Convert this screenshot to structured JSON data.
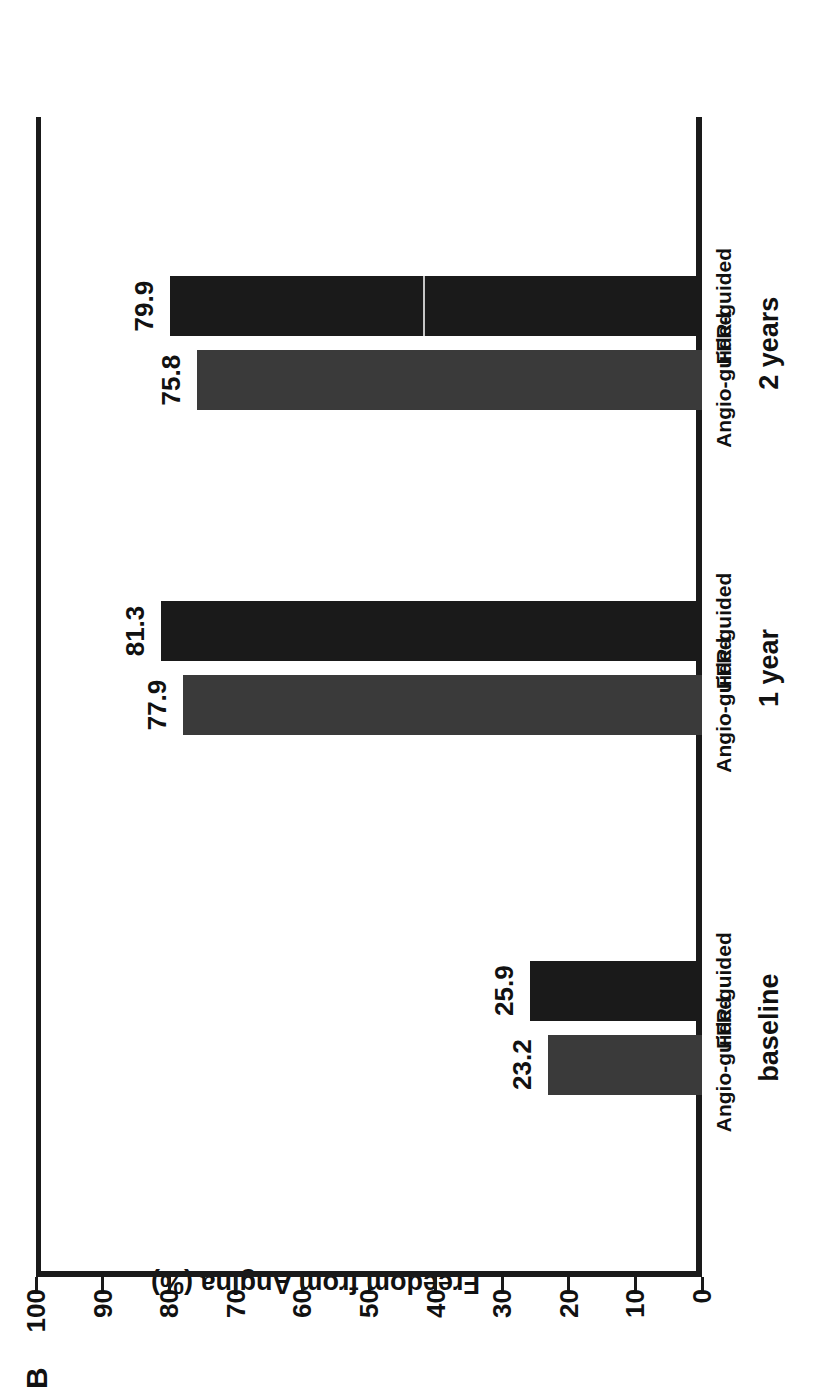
{
  "figure": {
    "panel_letter": "B",
    "axis_title": "Freedom from Angina (%)"
  },
  "chart_data": {
    "type": "bar",
    "title": "Freedom from Angina (%)",
    "xlabel": "",
    "ylabel": "Freedom from Angina (%)",
    "ylim": [
      0,
      100
    ],
    "ytick_labels": [
      "0",
      "10",
      "20",
      "30",
      "40",
      "50",
      "60",
      "70",
      "80",
      "90",
      "100"
    ],
    "ytick_values": [
      0,
      10,
      20,
      30,
      40,
      50,
      60,
      70,
      80,
      90,
      100
    ],
    "grid": false,
    "legend": "none",
    "categories": [
      "baseline",
      "1 year",
      "2 years"
    ],
    "series": [
      {
        "name": "Angio-guided",
        "color": "#3a3a3a",
        "values": [
          23.2,
          77.9,
          75.8
        ]
      },
      {
        "name": "FFR-guided",
        "color": "#1a1a1a",
        "values": [
          25.9,
          81.3,
          79.9
        ]
      }
    ],
    "bars": [
      {
        "group": "baseline",
        "series": "Angio-guided",
        "value": 23.2,
        "label": "23.2",
        "color": "#3a3a3a"
      },
      {
        "group": "baseline",
        "series": "FFR-guided",
        "value": 25.9,
        "label": "25.9",
        "color": "#1a1a1a"
      },
      {
        "group": "1 year",
        "series": "Angio-guided",
        "value": 77.9,
        "label": "77.9",
        "color": "#3a3a3a"
      },
      {
        "group": "1 year",
        "series": "FFR-guided",
        "value": 81.3,
        "label": "81.3",
        "color": "#1a1a1a"
      },
      {
        "group": "2 years",
        "series": "Angio-guided",
        "value": 75.8,
        "label": "75.8",
        "color": "#3a3a3a"
      },
      {
        "group": "2 years",
        "series": "FFR-guided",
        "value": 79.9,
        "label": "79.9",
        "color": "#1a1a1a"
      }
    ]
  },
  "colors": {
    "angio": "#3a3a3a",
    "ffr": "#1a1a1a",
    "axis": "#1a1a1a",
    "background": "#ffffff"
  }
}
